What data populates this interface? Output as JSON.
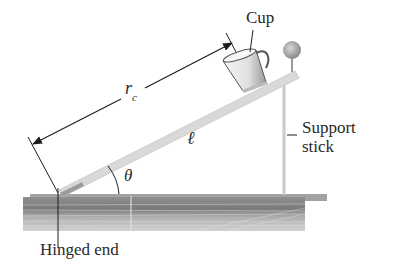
{
  "figure": {
    "type": "physics-diagram"
  },
  "labels": {
    "cup": "Cup",
    "support_line1": "Support",
    "support_line2": "stick",
    "hinge": "Hinged end",
    "rc_main": "r",
    "rc_sub": "c",
    "ell": "ℓ",
    "theta": "θ"
  },
  "colors": {
    "board": "#d6d6d6",
    "board_edge": "#b5b5b5",
    "table_top": "#9a9a9a",
    "table_body": "#bdbdbd",
    "line": "#1e1e1e",
    "text": "#2a2a2a"
  }
}
